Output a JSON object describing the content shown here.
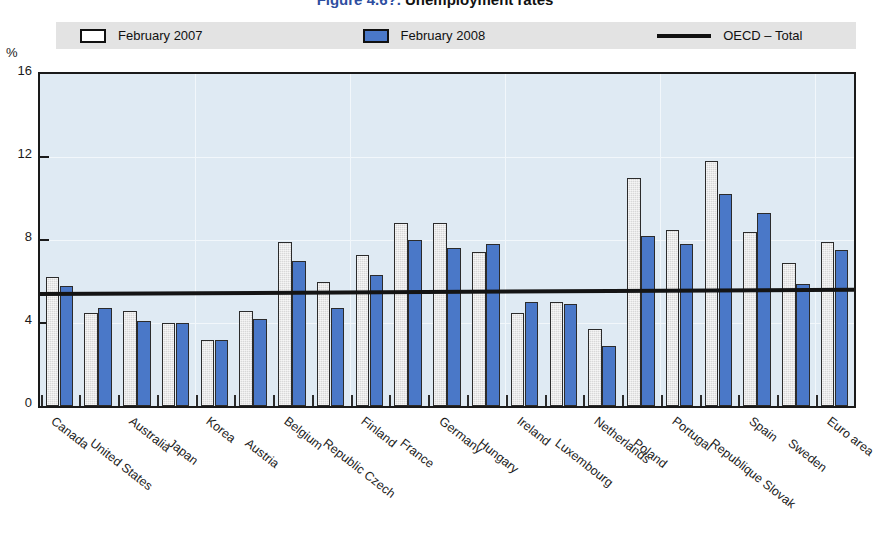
{
  "title": {
    "figure_number": "Figure 4.6?.",
    "figure_text": "Unemployment rates"
  },
  "axis_unit": "%",
  "legend": [
    {
      "label": "February 2007",
      "type": "swatch-white",
      "color": "#ffffff"
    },
    {
      "label": "February 2008",
      "type": "swatch-blue",
      "color": "#4a78c8"
    },
    {
      "label": "OECD – Total",
      "type": "line",
      "color": "#111111"
    }
  ],
  "chart_data": {
    "type": "bar",
    "title": "Unemployment rates",
    "xlabel": "",
    "ylabel": "%",
    "ylim": [
      0,
      16
    ],
    "yticks": [
      0,
      4,
      8,
      12,
      16
    ],
    "ytick_labels": [
      "0",
      "4",
      "8",
      "12",
      "16"
    ],
    "grid": true,
    "legend_position": "top",
    "categories": [
      "Canada",
      "United States",
      "Australia",
      "Japan",
      "Korea",
      "Austria",
      "Belgium",
      "Republic Czech",
      "Finland",
      "France",
      "Germany",
      "Hungary",
      "Ireland",
      "Luxembourg",
      "Netherlands",
      "Poland",
      "Portugal",
      "Republique Slovak",
      "Spain",
      "Sweden",
      "Euro area"
    ],
    "series": [
      {
        "name": "February 2007",
        "color": "#d8d8d8",
        "values": [
          6.2,
          4.5,
          4.6,
          4.0,
          3.2,
          4.6,
          7.9,
          6.0,
          7.3,
          8.8,
          8.8,
          7.4,
          4.5,
          5.0,
          3.7,
          11.0,
          8.5,
          11.8,
          8.4,
          6.9,
          7.9
        ]
      },
      {
        "name": "February 2008",
        "color": "#4a78c8",
        "values": [
          5.8,
          4.7,
          4.1,
          4.0,
          3.2,
          4.2,
          7.0,
          4.7,
          6.3,
          8.0,
          7.6,
          7.8,
          5.0,
          4.9,
          2.9,
          8.2,
          7.8,
          10.2,
          9.3,
          5.9,
          7.5
        ]
      }
    ],
    "reference_line": {
      "name": "OECD – Total",
      "color": "#111111",
      "value_start": 5.5,
      "value_end": 5.7
    }
  }
}
